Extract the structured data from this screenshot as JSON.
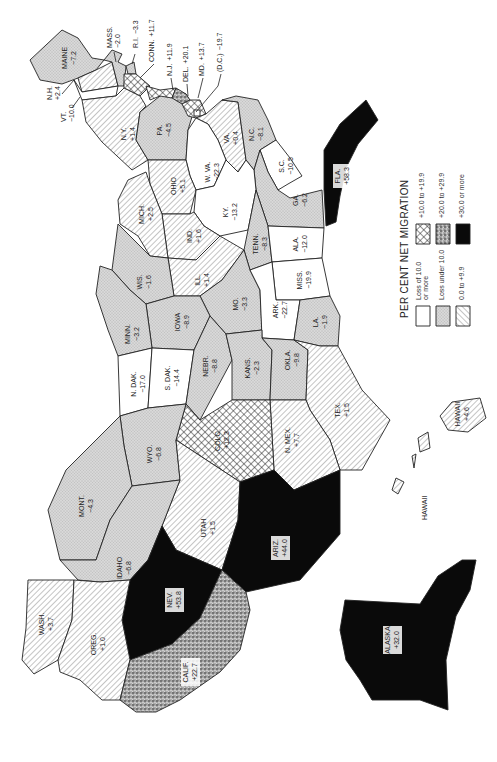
{
  "title": "PER CENT NET MIGRATION",
  "colors": {
    "loss_10_or_more": "#ffffff",
    "loss_under_10": "#d9d9d9",
    "gain_0_to_9_9": "#ffffff",
    "gain_10_to_19_9": "#ffffff",
    "gain_20_to_29_9": "#9a9a9a",
    "gain_30_or_more": "#0a0a0a",
    "stroke": "#222222"
  },
  "legend": [
    {
      "key": "loss_10_or_more",
      "label": "Loss of 10.0",
      "label2": "or more"
    },
    {
      "key": "loss_under_10",
      "label": "Loss under 10.0",
      "label2": ""
    },
    {
      "key": "gain_0_to_9_9",
      "label": "0.0 to +9.9",
      "label2": ""
    },
    {
      "key": "gain_10_to_19_9",
      "label": "+10.0 to +19.9",
      "label2": ""
    },
    {
      "key": "gain_20_to_29_9",
      "label": "+20.0 to +29.9",
      "label2": ""
    },
    {
      "key": "gain_30_or_more",
      "label": "+30.0 or more",
      "label2": ""
    }
  ],
  "states": {
    "WASH": {
      "name": "WASH.",
      "value": "+3.7",
      "cat": "gain_0_to_9_9"
    },
    "OREG": {
      "name": "OREG.",
      "value": "+1.0",
      "cat": "gain_0_to_9_9"
    },
    "CALIF": {
      "name": "CALIF.",
      "value": "+22.7",
      "cat": "gain_20_to_29_9"
    },
    "NEV": {
      "name": "NEV.",
      "value": "+53.8",
      "cat": "gain_30_or_more"
    },
    "IDAHO": {
      "name": "IDAHO",
      "value": "−6.8",
      "cat": "loss_under_10"
    },
    "MONT": {
      "name": "MONT.",
      "value": "−4.3",
      "cat": "loss_under_10"
    },
    "WYO": {
      "name": "WYO.",
      "value": "−6.8",
      "cat": "loss_under_10"
    },
    "UTAH": {
      "name": "UTAH",
      "value": "+1.5",
      "cat": "gain_0_to_9_9"
    },
    "ARIZ": {
      "name": "ARIZ.",
      "value": "+44.0",
      "cat": "gain_30_or_more"
    },
    "COLO": {
      "name": "COLO.",
      "value": "+12.3",
      "cat": "gain_10_to_19_9"
    },
    "NMEX": {
      "name": "N. MEX.",
      "value": "+7.7",
      "cat": "gain_0_to_9_9"
    },
    "NDAK": {
      "name": "N. DAK.",
      "value": "−17.0",
      "cat": "loss_10_or_more"
    },
    "SDAK": {
      "name": "S. DAK.",
      "value": "−14.4",
      "cat": "loss_10_or_more"
    },
    "NEBR": {
      "name": "NEBR.",
      "value": "−8.8",
      "cat": "loss_under_10"
    },
    "KANS": {
      "name": "KANS.",
      "value": "−2.3",
      "cat": "loss_under_10"
    },
    "OKLA": {
      "name": "OKLA.",
      "value": "−9.8",
      "cat": "loss_under_10"
    },
    "TEX": {
      "name": "TEX.",
      "value": "+1.5",
      "cat": "gain_0_to_9_9"
    },
    "MINN": {
      "name": "MINN.",
      "value": "−3.2",
      "cat": "loss_under_10"
    },
    "IOWA": {
      "name": "IOWA",
      "value": "−8.9",
      "cat": "loss_under_10"
    },
    "MO": {
      "name": "MO.",
      "value": "−3.3",
      "cat": "loss_under_10"
    },
    "ARK": {
      "name": "ARK.",
      "value": "−22.7",
      "cat": "loss_10_or_more"
    },
    "LA": {
      "name": "LA.",
      "value": "−1.9",
      "cat": "loss_under_10"
    },
    "WIS": {
      "name": "WIS.",
      "value": "−1.6",
      "cat": "loss_under_10"
    },
    "ILL": {
      "name": "ILL.",
      "value": "+1.4",
      "cat": "gain_0_to_9_9"
    },
    "MICH": {
      "name": "MICH.",
      "value": "+2.5",
      "cat": "gain_0_to_9_9"
    },
    "IND": {
      "name": "IND.",
      "value": "+1.6",
      "cat": "gain_0_to_9_9"
    },
    "OHIO": {
      "name": "OHIO",
      "value": "+5.1",
      "cat": "gain_0_to_9_9"
    },
    "KY": {
      "name": "KY.",
      "value": "−13.2",
      "cat": "loss_10_or_more"
    },
    "TENN": {
      "name": "TENN.",
      "value": "−8.3",
      "cat": "loss_under_10"
    },
    "MISS": {
      "name": "MISS.",
      "value": "−19.9",
      "cat": "loss_10_or_more"
    },
    "ALA": {
      "name": "ALA.",
      "value": "−12.0",
      "cat": "loss_10_or_more"
    },
    "GA": {
      "name": "GA.",
      "value": "−6.2",
      "cat": "loss_under_10"
    },
    "FLA": {
      "name": "FLA.",
      "value": "+58.3",
      "cat": "gain_30_or_more"
    },
    "SC": {
      "name": "S.C.",
      "value": "−10.5",
      "cat": "loss_10_or_more"
    },
    "NC": {
      "name": "N.C.",
      "value": "−8.1",
      "cat": "loss_under_10"
    },
    "VA": {
      "name": "VA.",
      "value": "+0.4",
      "cat": "gain_0_to_9_9"
    },
    "WVA": {
      "name": "W. VA.",
      "value": "−22.3",
      "cat": "loss_10_or_more"
    },
    "PA": {
      "name": "PA.",
      "value": "−4.5",
      "cat": "loss_under_10"
    },
    "NY": {
      "name": "N.Y.",
      "value": "+1.4",
      "cat": "gain_0_to_9_9"
    },
    "VT": {
      "name": "VT.",
      "value": "−10.0",
      "cat": "loss_10_or_more"
    },
    "NH": {
      "name": "N.H.",
      "value": "+2.4",
      "cat": "gain_0_to_9_9"
    },
    "MAINE": {
      "name": "MAINE",
      "value": "−7.2",
      "cat": "loss_under_10"
    },
    "MASS": {
      "name": "MASS.",
      "value": "−2.0",
      "cat": "loss_under_10"
    },
    "RI": {
      "name": "R.I.",
      "value": "−3.3",
      "cat": "loss_under_10"
    },
    "CONN": {
      "name": "CONN.",
      "value": "+11.7",
      "cat": "gain_10_to_19_9"
    },
    "NJ": {
      "name": "N.J.",
      "value": "+11.9",
      "cat": "gain_10_to_19_9"
    },
    "DEL": {
      "name": "DEL.",
      "value": "+20.1",
      "cat": "gain_20_to_29_9"
    },
    "MD": {
      "name": "MD.",
      "value": "+13.7",
      "cat": "gain_10_to_19_9"
    },
    "DC": {
      "name": "(D.C.)",
      "value": "−19.7",
      "cat": "loss_10_or_more"
    },
    "ALASKA": {
      "name": "ALASKA",
      "value": "+32.0",
      "cat": "gain_30_or_more"
    },
    "HAWAII": {
      "name": "HAWAII",
      "value": "+4.6",
      "cat": "gain_0_to_9_9"
    }
  }
}
